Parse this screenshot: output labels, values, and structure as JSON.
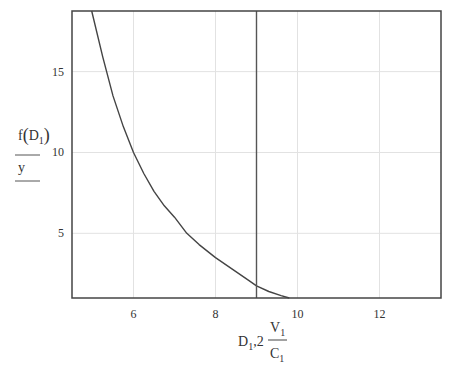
{
  "chart_data": {
    "type": "line",
    "title": "",
    "xlabel": {
      "text": "D1,2 V1/C1",
      "parts": {
        "d": "D",
        "d_sub": "1",
        "sep": ",2",
        "num": "V",
        "num_sub": "1",
        "den": "C",
        "den_sub": "1"
      }
    },
    "ylabel": {
      "text": "f(D1) / y",
      "parts": {
        "f": "f",
        "open": "(",
        "d": "D",
        "d_sub": "1",
        "close": ")",
        "y": "y"
      }
    },
    "xlim": [
      4.5,
      13.5
    ],
    "ylim": [
      1.0,
      18.75
    ],
    "x_ticks": [
      6,
      8,
      10,
      12
    ],
    "x_tick_labels": [
      "6",
      "8",
      "10",
      "12"
    ],
    "y_ticks": [
      5,
      10,
      15
    ],
    "y_tick_labels": [
      "5",
      "10",
      "15"
    ],
    "grid": true,
    "legend": "none",
    "series": [
      {
        "name": "f(D1)",
        "color": "#444444",
        "x": [
          4.98,
          5.25,
          5.5,
          5.75,
          6.0,
          6.25,
          6.5,
          6.75,
          7.0,
          7.3,
          7.6,
          8.0,
          8.4,
          8.8,
          9.0,
          9.3,
          9.6,
          9.8
        ],
        "y": [
          18.75,
          15.9,
          13.5,
          11.6,
          10.0,
          8.7,
          7.6,
          6.7,
          6.0,
          5.0,
          4.3,
          3.5,
          2.8,
          2.1,
          1.75,
          1.4,
          1.15,
          1.0
        ]
      },
      {
        "name": "y",
        "color": "#555555",
        "x": [
          9.0,
          9.0
        ],
        "y": [
          1.0,
          18.75
        ]
      }
    ]
  }
}
